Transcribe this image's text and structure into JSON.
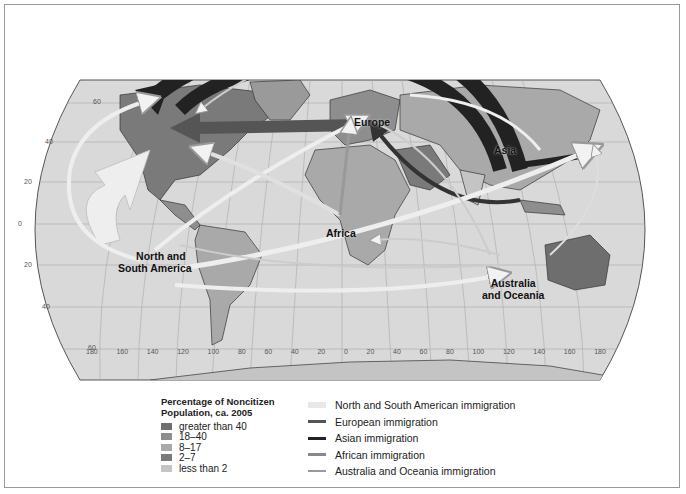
{
  "map": {
    "region_labels": {
      "europe": "Europe",
      "asia": "Asia",
      "africa": "Africa",
      "americas_line1": "North and",
      "americas_line2": "South America",
      "oceania_line1": "Australia",
      "oceania_line2": "and Oceania"
    },
    "latitude_ticks": [
      "60",
      "40",
      "20",
      "0",
      "20",
      "40",
      "60"
    ],
    "longitude_ticks": [
      "180",
      "160",
      "140",
      "120",
      "100",
      "80",
      "60",
      "40",
      "20",
      "0",
      "20",
      "40",
      "60",
      "80",
      "100",
      "120",
      "140",
      "160",
      "180"
    ]
  },
  "legend_population": {
    "title_line1": "Percentage of Noncitizen",
    "title_line2": "Population, ca. 2005",
    "items": [
      {
        "label": "greater than 40",
        "color": "#6e6e6e"
      },
      {
        "label": "18–40",
        "color": "#8e8e8e"
      },
      {
        "label": "8–17",
        "color": "#a9a9a9"
      },
      {
        "label": "2–7",
        "color": "#7a7a7a"
      },
      {
        "label": "less than 2",
        "color": "#c4c4c4"
      }
    ]
  },
  "legend_immigration": {
    "items": [
      {
        "label": "North and South American immigration",
        "color": "#e8e8e8"
      },
      {
        "label": "European immigration",
        "color": "#555555"
      },
      {
        "label": "Asian immigration",
        "color": "#222222"
      },
      {
        "label": "African immigration",
        "color": "#888888"
      },
      {
        "label": "Australia and Oceania immigration",
        "color": "#9a9a9a"
      }
    ]
  }
}
